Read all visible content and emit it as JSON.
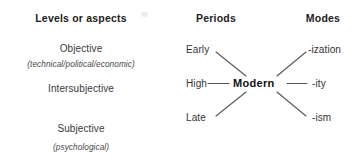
{
  "diagram": {
    "title_columns": [
      {
        "id": "levels",
        "label": "Levels or aspects"
      },
      {
        "id": "periods",
        "label": "Periods"
      },
      {
        "id": "modes",
        "label": "Modes"
      }
    ],
    "levels": [
      {
        "id": "objective",
        "label": "Objective",
        "qualifier": "(technical/political/economic)"
      },
      {
        "id": "intersubjective",
        "label": "Intersubjective",
        "qualifier": ""
      },
      {
        "id": "subjective",
        "label": "Subjective",
        "qualifier": "(psychological)"
      }
    ],
    "hub": {
      "label": "Modern"
    },
    "periods": [
      {
        "id": "early",
        "label": "Early"
      },
      {
        "id": "high",
        "label": "High"
      },
      {
        "id": "late",
        "label": "Late"
      }
    ],
    "modes": [
      {
        "id": "ization",
        "label": "-ization"
      },
      {
        "id": "ity",
        "label": "-ity"
      },
      {
        "id": "ism",
        "label": "-ism"
      }
    ],
    "colors": {
      "background": "#ffffff",
      "text": "#333333",
      "heading": "#1d1d1d",
      "line": "#555555"
    }
  }
}
